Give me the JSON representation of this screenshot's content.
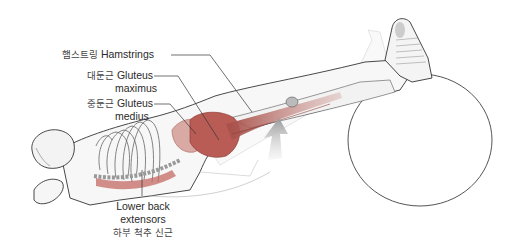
{
  "figure": {
    "colors": {
      "muscle": "#b85c55",
      "muscle_light": "#d79a92",
      "bone": "#c9c9c9",
      "outline": "#333333",
      "arrow": "#b0b0b0",
      "leader_line": "#333333"
    }
  },
  "labels": [
    {
      "id": "hamstrings",
      "ko": "햄스트링",
      "en": "Hamstrings"
    },
    {
      "id": "gluteus-maximus",
      "ko": "대둔근",
      "en": "Gluteus",
      "en2": "maximus"
    },
    {
      "id": "gluteus-medius",
      "ko": "중둔근",
      "en": "Gluteus",
      "en2": "medius"
    },
    {
      "id": "lower-back-extensors",
      "en": "Lower back",
      "en2": "extensors",
      "ko": "하부 척추 신근"
    }
  ]
}
